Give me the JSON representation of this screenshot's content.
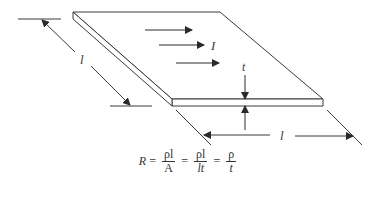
{
  "figure": {
    "type": "thin-film-resistor-diagram",
    "labels": {
      "length_left": "l",
      "length_bottom": "l",
      "current": "I",
      "thickness": "t"
    },
    "current_arrow_count": 3
  },
  "equation": {
    "lhs": "R",
    "equals": "=",
    "term1": {
      "num": "ρl",
      "den": "A"
    },
    "term2": {
      "num": "ρl",
      "den": "lt"
    },
    "term3": {
      "num": "ρ",
      "den": "t"
    }
  },
  "colors": {
    "line": "#3a3a3a",
    "background": "#ffffff"
  }
}
